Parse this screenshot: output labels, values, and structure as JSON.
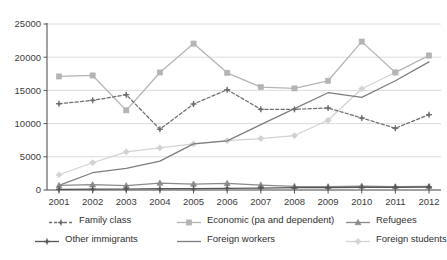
{
  "chart_data": {
    "type": "line",
    "title": "",
    "xlabel": "",
    "ylabel": "",
    "categories": [
      "2001",
      "2002",
      "2003",
      "2004",
      "2005",
      "2006",
      "2007",
      "2008",
      "2009",
      "2010",
      "2011",
      "2012"
    ],
    "x_tick_labels": [
      "2001",
      "2002",
      "2003",
      "2004",
      "2005",
      "2006",
      "2007",
      "2008",
      "2009",
      "2010",
      "2011",
      "2012"
    ],
    "y_tick_labels": [
      "0",
      "5000",
      "10000",
      "15000",
      "20000",
      "25000"
    ],
    "y_ticks": [
      0,
      5000,
      10000,
      15000,
      20000,
      25000
    ],
    "ylim": [
      0,
      25000
    ],
    "grid": "horizontal",
    "legend_position": "below",
    "series": [
      {
        "name": "Family class",
        "color": "#6e6e6e",
        "marker": "cross",
        "dash": "dashed",
        "values": [
          13000,
          13500,
          14350,
          9150,
          12950,
          15100,
          12150,
          12150,
          12350,
          10850,
          9300,
          11350
        ]
      },
      {
        "name": "Economic (pa and dependent)",
        "color": "#b4b4b4",
        "marker": "square",
        "dash": "solid",
        "values": [
          17100,
          17250,
          12000,
          17700,
          22050,
          17650,
          15500,
          15300,
          16450,
          22350,
          17700,
          20250
        ]
      },
      {
        "name": "Refugees",
        "color": "#8a8a8a",
        "marker": "triangle",
        "dash": "solid",
        "values": [
          700,
          800,
          650,
          1050,
          900,
          1000,
          750,
          550,
          500,
          600,
          500,
          550
        ]
      },
      {
        "name": "Other immigrants",
        "color": "#555555",
        "marker": "cross",
        "dash": "solid",
        "values": [
          100,
          120,
          150,
          200,
          200,
          250,
          300,
          350,
          350,
          400,
          400,
          450
        ]
      },
      {
        "name": "Foreign workers",
        "color": "#7d7d7d",
        "marker": "none",
        "dash": "solid",
        "values": [
          700,
          2600,
          3250,
          4350,
          6950,
          7400,
          9850,
          12250,
          14650,
          13950,
          16450,
          19300
        ]
      },
      {
        "name": "Foreign students",
        "color": "#d2d2d2",
        "marker": "diamond",
        "dash": "solid",
        "values": [
          2300,
          4100,
          5750,
          6350,
          6950,
          7450,
          7750,
          8200,
          10500,
          15250,
          17700,
          20300
        ]
      }
    ]
  },
  "legend": {
    "items": [
      {
        "label": "Family class"
      },
      {
        "label": "Economic (pa and dependent)"
      },
      {
        "label": "Refugees"
      },
      {
        "label": "Other immigrants"
      },
      {
        "label": "Foreign workers"
      },
      {
        "label": "Foreign students"
      }
    ]
  }
}
